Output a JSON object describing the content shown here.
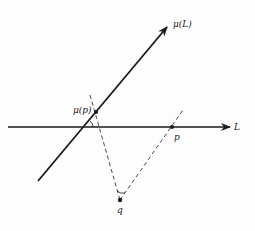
{
  "diagram": {
    "labels": {
      "mu_L": "μ(L)",
      "L": "L",
      "mu_p": "μ(p)",
      "p": "p",
      "q": "q"
    },
    "colors": {
      "ink": "#1a1a1a",
      "background": "#fdfdfd"
    },
    "elements": [
      {
        "id": "line-L",
        "type": "arrow-line",
        "from": [
          8,
          127
        ],
        "to": [
          230,
          127
        ],
        "label": "L"
      },
      {
        "id": "line-mu-L",
        "type": "arrow-line",
        "from": [
          38,
          181
        ],
        "to": [
          167,
          27
        ],
        "label": "μ(L)"
      },
      {
        "id": "point-mu-p",
        "type": "point",
        "at": [
          96,
          112
        ],
        "label": "μ(p)"
      },
      {
        "id": "point-p",
        "type": "point",
        "at": [
          172,
          127
        ],
        "label": "p"
      },
      {
        "id": "point-q",
        "type": "point",
        "at": [
          120,
          200
        ],
        "label": "q"
      },
      {
        "id": "dashed-q-mu-p",
        "type": "dashed-line",
        "from": [
          90,
          95
        ],
        "to": [
          120,
          200
        ]
      },
      {
        "id": "dashed-q-p",
        "type": "dashed-line",
        "from": [
          120,
          200
        ],
        "to": [
          183,
          110
        ]
      },
      {
        "id": "angle-at-intersection",
        "type": "angle-arc",
        "at": [
          85,
          127
        ]
      },
      {
        "id": "angle-at-q",
        "type": "angle-arc",
        "at": [
          120,
          200
        ]
      }
    ]
  }
}
